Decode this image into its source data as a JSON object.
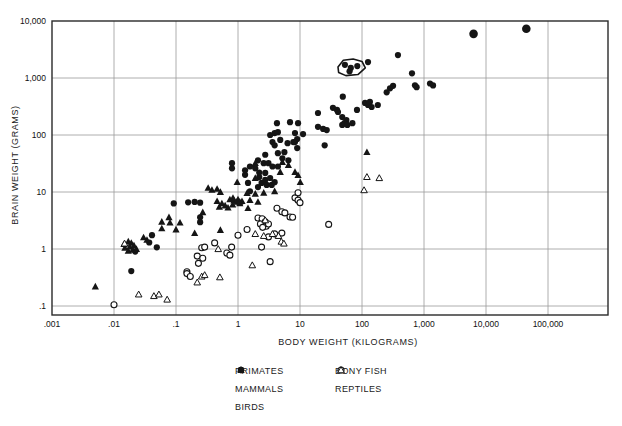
{
  "figure": {
    "x_axis": {
      "title": "BODY WEIGHT (KILOGRAMS)",
      "ticks": [
        {
          "label": ".001",
          "value": 0.001
        },
        {
          "label": ".01",
          "value": 0.01
        },
        {
          "label": ".1",
          "value": 0.1
        },
        {
          "label": "1",
          "value": 1
        },
        {
          "label": "10",
          "value": 10
        },
        {
          "label": "100",
          "value": 100
        },
        {
          "label": "1,000",
          "value": 1000
        },
        {
          "label": "10,000",
          "value": 10000
        },
        {
          "label": "100,000",
          "value": 100000
        }
      ]
    },
    "y_axis": {
      "title": "BRAIN WEIGHT (GRAMS)",
      "ticks": [
        {
          "label": "10,000",
          "value": 10000
        },
        {
          "label": "1,000",
          "value": 1000
        },
        {
          "label": "100",
          "value": 100
        },
        {
          "label": "10",
          "value": 10
        },
        {
          "label": "1",
          "value": 1
        },
        {
          "label": ".1",
          "value": 0.1
        }
      ]
    },
    "legend": {
      "columns": [
        [
          {
            "label": "PRIMATES",
            "marker": "dot"
          },
          {
            "label": "MAMMALS",
            "marker": "dot"
          },
          {
            "label": "BIRDS",
            "marker": "tri_filled"
          }
        ],
        [
          {
            "label": "BONY FISH",
            "marker": "circle_open"
          },
          {
            "label": "REPTILES",
            "marker": "tri_open"
          }
        ]
      ]
    }
  },
  "colors": {
    "marker": "#151515",
    "grid": "#9a9a9a",
    "axis": "#2a2a2a",
    "text": "#111111",
    "background": "#ffffff"
  },
  "chart_data": {
    "type": "scatter",
    "title": "",
    "xlabel": "BODY WEIGHT (KILOGRAMS)",
    "ylabel": "BRAIN WEIGHT (GRAMS)",
    "x_scale": "log",
    "y_scale": "log",
    "xlim": [
      0.001,
      100000
    ],
    "ylim": [
      0.1,
      10000
    ],
    "grid": true,
    "legend_position": "bottom",
    "series": [
      {
        "name": "PRIMATES",
        "marker": "dot",
        "points": [
          [
            0.8,
            32
          ],
          [
            1.3,
            24
          ],
          [
            1.56,
            28
          ],
          [
            2.2,
            22
          ],
          [
            2.75,
            45
          ],
          [
            3.6,
            75
          ],
          [
            3.9,
            66
          ],
          [
            4.4,
            48
          ],
          [
            4.8,
            82
          ],
          [
            5.6,
            50
          ],
          [
            6.3,
            72
          ],
          [
            7.8,
            75
          ],
          [
            9,
            59
          ],
          [
            53,
            1700
          ],
          [
            66,
            1500
          ],
          [
            84,
            1620
          ],
          [
            63,
            1310
          ]
        ]
      },
      {
        "name": "MAMMALS",
        "marker": "dot",
        "points": [
          [
            0.019,
            0.41
          ],
          [
            0.022,
            0.9
          ],
          [
            0.037,
            1.3
          ],
          [
            0.041,
            1.75
          ],
          [
            0.049,
            1.07
          ],
          [
            0.092,
            6.3
          ],
          [
            0.157,
            6.6
          ],
          [
            0.2,
            6.7
          ],
          [
            0.245,
            6.5
          ],
          [
            0.245,
            3.6
          ],
          [
            0.245,
            2.95
          ],
          [
            0.8,
            26
          ],
          [
            1.3,
            20
          ],
          [
            1.45,
            14.4
          ],
          [
            1.56,
            10.3
          ],
          [
            1.9,
            26
          ],
          [
            2.1,
            36
          ],
          [
            2.6,
            32
          ],
          [
            3.1,
            32
          ],
          [
            2.2,
            18.3
          ],
          [
            2.4,
            14.4
          ],
          [
            2.9,
            13.3
          ],
          [
            2.1,
            12.2
          ],
          [
            3.5,
            13.3
          ],
          [
            3.9,
            14.9
          ],
          [
            2.75,
            16.3
          ],
          [
            3.3,
            17.6
          ],
          [
            2.75,
            21.6
          ],
          [
            3.6,
            28
          ],
          [
            4.4,
            28
          ],
          [
            3.3,
            100
          ],
          [
            3.9,
            108
          ],
          [
            4.4,
            112
          ],
          [
            4.25,
            161
          ],
          [
            6.9,
            168
          ],
          [
            9.3,
            161
          ],
          [
            5.2,
            39
          ],
          [
            6.5,
            36
          ],
          [
            11.2,
            104
          ],
          [
            8.3,
            108
          ],
          [
            9,
            85
          ],
          [
            8.3,
            75
          ],
          [
            19.5,
            139
          ],
          [
            23.6,
            128
          ],
          [
            27,
            122
          ],
          [
            25,
            66
          ],
          [
            19.5,
            243
          ],
          [
            34,
            300
          ],
          [
            39.5,
            275
          ],
          [
            41,
            253
          ],
          [
            49,
            470
          ],
          [
            48,
            207
          ],
          [
            56,
            183
          ],
          [
            48,
            150
          ],
          [
            52,
            161
          ],
          [
            58,
            150
          ],
          [
            70,
            161
          ],
          [
            83,
            275
          ],
          [
            112,
            365
          ],
          [
            125,
            336
          ],
          [
            134,
            380
          ],
          [
            143,
            310
          ],
          [
            180,
            336
          ],
          [
            250,
            560
          ],
          [
            283,
            660
          ],
          [
            317,
            730
          ],
          [
            380,
            2520
          ],
          [
            125,
            1900
          ],
          [
            640,
            1210
          ],
          [
            715,
            745
          ],
          [
            760,
            690
          ],
          [
            1250,
            800
          ],
          [
            1400,
            740
          ]
        ]
      },
      {
        "name": "MAMMALS_LARGE",
        "marker": "dot_large",
        "points": [
          [
            6300,
            5950
          ],
          [
            44700,
            7300
          ]
        ]
      },
      {
        "name": "BIRDS",
        "marker": "tri_filled",
        "points": [
          [
            0.005,
            0.22
          ],
          [
            0.0145,
            1.22
          ],
          [
            0.017,
            1.35
          ],
          [
            0.019,
            1.28
          ],
          [
            0.015,
            1.05
          ],
          [
            0.018,
            1.1
          ],
          [
            0.021,
            1.15
          ],
          [
            0.017,
            0.93
          ],
          [
            0.02,
            0.97
          ],
          [
            0.023,
            1.0
          ],
          [
            0.03,
            1.6
          ],
          [
            0.034,
            1.44
          ],
          [
            0.059,
            3.0
          ],
          [
            0.059,
            2.3
          ],
          [
            0.077,
            3.6
          ],
          [
            0.08,
            2.9
          ],
          [
            0.1,
            2.2
          ],
          [
            0.116,
            2.9
          ],
          [
            0.2,
            1.9
          ],
          [
            0.27,
            4.4
          ],
          [
            0.33,
            11.8
          ],
          [
            0.38,
            10.9
          ],
          [
            0.46,
            11.3
          ],
          [
            0.52,
            10
          ],
          [
            0.46,
            6.9
          ],
          [
            0.55,
            6.3
          ],
          [
            0.62,
            5.8
          ],
          [
            0.69,
            5.3
          ],
          [
            0.5,
            5.5
          ],
          [
            0.74,
            7.4
          ],
          [
            0.86,
            7.1
          ],
          [
            0.96,
            6.7
          ],
          [
            1.07,
            6.3
          ],
          [
            0.82,
            6.0
          ],
          [
            1.0,
            7.4
          ],
          [
            1.16,
            6.9
          ],
          [
            0.52,
            2.15
          ],
          [
            0.97,
            14.9
          ],
          [
            1.4,
            9.6
          ],
          [
            1.45,
            5.2
          ],
          [
            1.9,
            32
          ],
          [
            0.83,
            7.9
          ],
          [
            1.07,
            6.7
          ],
          [
            1.56,
            7.2
          ],
          [
            2.1,
            6.7
          ],
          [
            1.9,
            9.3
          ],
          [
            2.6,
            9.7
          ],
          [
            3.9,
            10.3
          ],
          [
            1.9,
            17.6
          ],
          [
            5.2,
            33.5
          ],
          [
            6.5,
            29.7
          ],
          [
            4.8,
            22.4
          ],
          [
            9.3,
            19.8
          ],
          [
            10.1,
            14.9
          ],
          [
            8.3,
            22.4
          ],
          [
            120,
            50
          ]
        ]
      },
      {
        "name": "BONY FISH",
        "marker": "circle_open",
        "points": [
          [
            0.01,
            0.105
          ],
          [
            0.15,
            0.4
          ],
          [
            0.15,
            0.37
          ],
          [
            0.17,
            0.33
          ],
          [
            0.22,
            0.75
          ],
          [
            0.23,
            0.56
          ],
          [
            0.26,
            1.05
          ],
          [
            0.29,
            1.08
          ],
          [
            0.27,
            0.69
          ],
          [
            0.42,
            1.28
          ],
          [
            0.66,
            0.85
          ],
          [
            0.74,
            0.78
          ],
          [
            0.79,
            1.08
          ],
          [
            1.0,
            1.74
          ],
          [
            1.4,
            2.2
          ],
          [
            2.4,
            1.08
          ],
          [
            3.3,
            0.6
          ],
          [
            2.1,
            3.5
          ],
          [
            2.45,
            3.4
          ],
          [
            2.75,
            3.0
          ],
          [
            2.3,
            2.75
          ],
          [
            2.85,
            2.5
          ],
          [
            2.5,
            2.4
          ],
          [
            3.1,
            2.75
          ],
          [
            3.1,
            1.63
          ],
          [
            3.9,
            1.84
          ],
          [
            5.1,
            1.9
          ],
          [
            4.25,
            5.2
          ],
          [
            5.1,
            4.5
          ],
          [
            5.7,
            4.3
          ],
          [
            6.9,
            3.65
          ],
          [
            7.6,
            3.6
          ],
          [
            8.3,
            7.9
          ],
          [
            9.3,
            7.2
          ],
          [
            9.3,
            9.7
          ],
          [
            10,
            6.5
          ],
          [
            29,
            2.7
          ]
        ]
      },
      {
        "name": "REPTILES",
        "marker": "tri_open",
        "points": [
          [
            0.0148,
            1.25
          ],
          [
            0.025,
            0.16
          ],
          [
            0.044,
            0.15
          ],
          [
            0.053,
            0.16
          ],
          [
            0.072,
            0.13
          ],
          [
            0.22,
            0.26
          ],
          [
            0.26,
            0.33
          ],
          [
            0.29,
            0.35
          ],
          [
            0.51,
            0.32
          ],
          [
            0.48,
            1.0
          ],
          [
            1.7,
            0.52
          ],
          [
            1.9,
            1.84
          ],
          [
            2.6,
            1.7
          ],
          [
            3.6,
            1.84
          ],
          [
            4.5,
            1.7
          ],
          [
            5.0,
            1.35
          ],
          [
            5.5,
            1.25
          ],
          [
            2.75,
            3.2
          ],
          [
            108,
            10.8
          ],
          [
            120,
            18.4
          ],
          [
            190,
            17.6
          ]
        ]
      }
    ],
    "annotations": {
      "hull_outline_points": [
        [
          41,
          1560
        ],
        [
          50,
          2050
        ],
        [
          72,
          2150
        ],
        [
          100,
          1950
        ],
        [
          113,
          1500
        ],
        [
          86,
          1150
        ],
        [
          55,
          1100
        ],
        [
          42,
          1250
        ]
      ]
    }
  }
}
